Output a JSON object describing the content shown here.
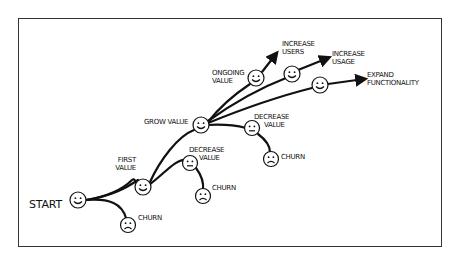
{
  "diagram": {
    "nodes": {
      "start": {
        "label": "START",
        "face": "smile"
      },
      "churn_start": {
        "label": "CHURN",
        "face": "frown"
      },
      "first_value": {
        "label_line1": "FIRST",
        "label_line2": "VALUE",
        "face": "smile"
      },
      "decrease_value_1": {
        "label_line1": "DECREASE",
        "label_line2": "VALUE",
        "face": "neutral"
      },
      "churn_1": {
        "label": "CHURN",
        "face": "frown"
      },
      "grow_value": {
        "label": "GROW VALUE",
        "face": "smile"
      },
      "decrease_value_2": {
        "label_line1": "DECREASE",
        "label_line2": "VALUE",
        "face": "neutral"
      },
      "churn_2": {
        "label": "CHURN",
        "face": "frown"
      },
      "ongoing_value": {
        "label_line1": "ONGOING",
        "label_line2": "VALUE",
        "face": "smile"
      },
      "increase_users": {
        "label_line1": "INCREASE",
        "label_line2": "USERS"
      },
      "increase_usage": {
        "label_line1": "INCREASE",
        "label_line2": "USAGE",
        "face": "smile"
      },
      "expand_functionality": {
        "label_line1": "EXPAND",
        "label_line2": "FUNCTIONALITY",
        "face": "smile"
      }
    },
    "edges": [
      {
        "from": "start",
        "to": "churn_start"
      },
      {
        "from": "start",
        "to": "first_value"
      },
      {
        "from": "first_value",
        "to": "decrease_value_1"
      },
      {
        "from": "decrease_value_1",
        "to": "churn_1"
      },
      {
        "from": "first_value",
        "to": "grow_value"
      },
      {
        "from": "grow_value",
        "to": "decrease_value_2"
      },
      {
        "from": "decrease_value_2",
        "to": "churn_2"
      },
      {
        "from": "grow_value",
        "to": "ongoing_value"
      },
      {
        "from": "ongoing_value",
        "to": "increase_users",
        "arrow": true
      },
      {
        "from": "grow_value",
        "to": "increase_usage",
        "arrow": true
      },
      {
        "from": "grow_value",
        "to": "expand_functionality",
        "arrow": true
      }
    ],
    "colors": {
      "stroke": "#111111",
      "background": "#ffffff",
      "frame": "#333333"
    }
  }
}
